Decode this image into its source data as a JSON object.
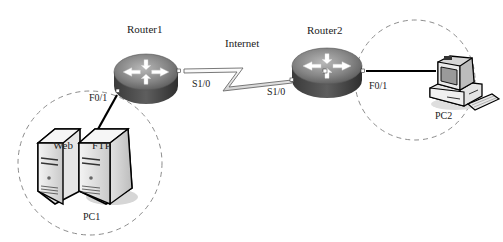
{
  "diagram": {
    "type": "network-topology",
    "nodes": {
      "router1": {
        "label": "Router1"
      },
      "router2": {
        "label": "Router2"
      },
      "internet": {
        "label": "Internet"
      },
      "pc1_group": {
        "label": "PC1",
        "servers": [
          {
            "label": "Web"
          },
          {
            "label": "FTP"
          }
        ]
      },
      "pc2": {
        "label": "PC2"
      }
    },
    "interfaces": {
      "router1_serial": "S1/0",
      "router1_fast": "F0/1",
      "router2_serial": "S1/0",
      "router2_fast": "F0/1"
    },
    "links": [
      {
        "from": "Router1 S1/0",
        "to": "Router2 S1/0",
        "style": "serial-lightning",
        "via": "Internet"
      },
      {
        "from": "Router1 F0/1",
        "to": "PC1 (Web/FTP servers)",
        "style": "ethernet"
      },
      {
        "from": "Router2 F0/1",
        "to": "PC2",
        "style": "ethernet"
      }
    ],
    "colors": {
      "router_top": "#8a8a8a",
      "router_side": "#4a4a4a",
      "arrows": "#ffffff",
      "dashed_circle": "#8c8c8c",
      "link": "#000000"
    }
  }
}
